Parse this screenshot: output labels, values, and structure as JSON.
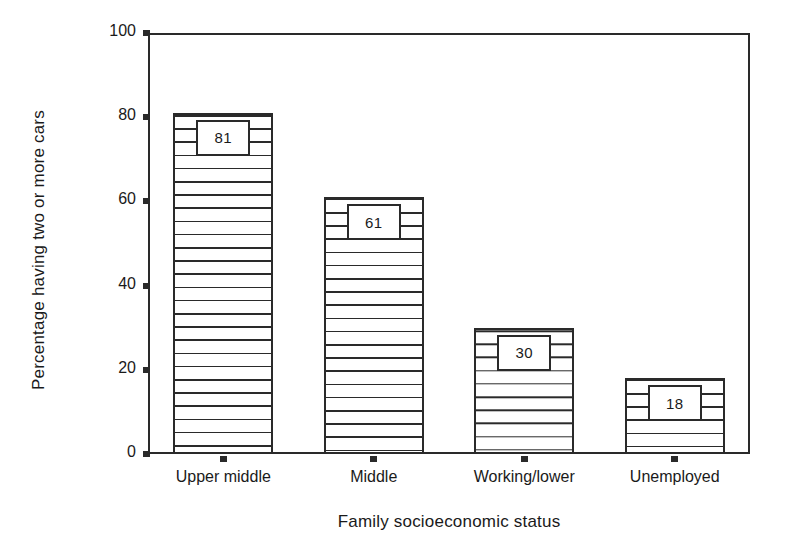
{
  "chart_data": {
    "type": "bar",
    "title": "",
    "xlabel": "Family socioeconomic status",
    "ylabel": "Percentage having two or more cars",
    "categories": [
      "Upper middle",
      "Middle",
      "Working/lower",
      "Unemployed"
    ],
    "values": [
      81,
      61,
      30,
      18
    ],
    "value_labels": [
      "81",
      "61",
      "30",
      "18"
    ],
    "ylim": [
      0,
      100
    ],
    "yticks": [
      0,
      20,
      40,
      60,
      80,
      100
    ],
    "ytick_labels": [
      "0",
      "20",
      "40",
      "60",
      "80",
      "100"
    ],
    "grid": false,
    "legend": null,
    "bar_style": {
      "fill": "horizontal-line-hatch",
      "edge_color": "#2a2a2a",
      "face_color": "#ffffff"
    },
    "axis_color": "#2a2a2a",
    "background_color": "#ffffff"
  }
}
